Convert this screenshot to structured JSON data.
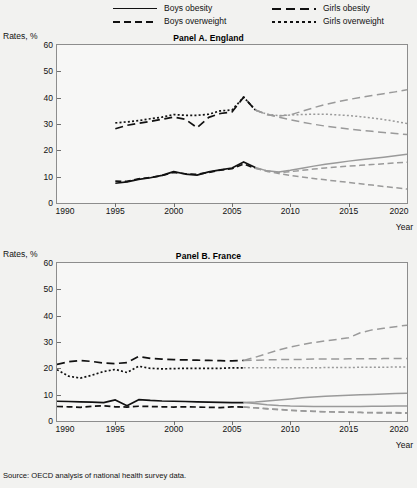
{
  "legend": {
    "items": [
      {
        "label": "Boys obesity",
        "style": "solid",
        "icon": "solid-line-swatch"
      },
      {
        "label": "Boys overweight",
        "style": "dash-medium",
        "icon": "dashed-line-swatch"
      },
      {
        "label": "Girls obesity",
        "style": "dash-long",
        "icon": "long-dashed-line-swatch"
      },
      {
        "label": "Girls overweight",
        "style": "dotted",
        "icon": "dotted-line-swatch"
      }
    ]
  },
  "source_note": "Source: OECD analysis of national health survey data.",
  "axis_labels": {
    "y": "Rates, %",
    "x": "Year"
  },
  "chart_data": [
    {
      "type": "line",
      "title": "Panel A. England",
      "xlabel": "Year",
      "ylabel": "Rates, %",
      "xlim": [
        1990,
        2020
      ],
      "ylim": [
        0,
        60
      ],
      "xticks": [
        1990,
        1995,
        2000,
        2005,
        2010,
        2015,
        2020
      ],
      "yticks": [
        0,
        10,
        20,
        30,
        40,
        50,
        60
      ],
      "grid": false,
      "legend_position": "top",
      "projection_starts": 2007,
      "series": [
        {
          "name": "Boys obesity",
          "style": "solid",
          "x": [
            1995,
            1996,
            1997,
            1998,
            1999,
            2000,
            2001,
            2002,
            2003,
            2004,
            2005,
            2006,
            2007,
            2008,
            2009,
            2010,
            2011,
            2012,
            2013,
            2014,
            2015,
            2016,
            2017,
            2018,
            2019,
            2020
          ],
          "values": [
            7.5,
            8.0,
            9.0,
            9.6,
            10.5,
            11.9,
            11.0,
            10.6,
            11.8,
            12.6,
            13.3,
            15.6,
            13.5,
            12.2,
            11.8,
            12.4,
            13.2,
            14.0,
            14.7,
            15.3,
            15.9,
            16.4,
            16.9,
            17.4,
            17.9,
            18.5
          ]
        },
        {
          "name": "Boys overweight",
          "style": "dash-medium",
          "x": [
            1995,
            1996,
            1997,
            1998,
            1999,
            2000,
            2001,
            2002,
            2003,
            2004,
            2005,
            2006,
            2007,
            2008,
            2009,
            2010,
            2011,
            2012,
            2013,
            2014,
            2015,
            2016,
            2017,
            2018,
            2019,
            2020
          ],
          "values": [
            8.3,
            8.2,
            9.2,
            9.7,
            10.4,
            11.6,
            11.1,
            10.9,
            11.6,
            12.5,
            13.0,
            14.8,
            13.2,
            12.2,
            11.6,
            11.9,
            12.4,
            12.9,
            13.3,
            13.7,
            14.0,
            14.3,
            14.6,
            14.9,
            15.2,
            15.5
          ]
        },
        {
          "name": "Girls obesity",
          "style": "dash-long",
          "x": [
            1995,
            1996,
            1997,
            1998,
            1999,
            2000,
            2001,
            2002,
            2003,
            2004,
            2005,
            2006,
            2007,
            2008,
            2009,
            2010,
            2011,
            2012,
            2013,
            2014,
            2015,
            2016,
            2017,
            2018,
            2019,
            2020
          ],
          "values": [
            28.2,
            29.5,
            30.3,
            31.0,
            31.8,
            32.6,
            31.8,
            28.6,
            32.5,
            34.0,
            34.6,
            40.2,
            35.3,
            33.5,
            33.0,
            33.5,
            34.8,
            36.2,
            37.4,
            38.4,
            39.3,
            40.1,
            40.8,
            41.5,
            42.2,
            43.0
          ]
        },
        {
          "name": "Girls overweight",
          "style": "dotted",
          "x": [
            1995,
            1996,
            1997,
            1998,
            1999,
            2000,
            2001,
            2002,
            2003,
            2004,
            2005,
            2006,
            2007,
            2008,
            2009,
            2010,
            2011,
            2012,
            2013,
            2014,
            2015,
            2016,
            2017,
            2018,
            2019,
            2020
          ],
          "values": [
            30.4,
            30.8,
            31.3,
            32.0,
            32.6,
            33.6,
            33.3,
            33.3,
            33.7,
            35.0,
            35.3,
            40.2,
            35.3,
            33.7,
            33.2,
            33.4,
            33.6,
            33.7,
            33.7,
            33.5,
            33.2,
            32.8,
            32.3,
            31.7,
            31.0,
            30.2
          ]
        },
        {
          "name": "Girls obesity projection low",
          "style": "dash-long",
          "x": [
            2007,
            2008,
            2009,
            2010,
            2011,
            2012,
            2013,
            2014,
            2015,
            2016,
            2017,
            2018,
            2019,
            2020
          ],
          "values": [
            35.3,
            33.7,
            32.6,
            31.6,
            30.7,
            29.9,
            29.2,
            28.6,
            28.1,
            27.6,
            27.2,
            26.8,
            26.4,
            26.0
          ],
          "is_projection": true
        },
        {
          "name": "Boys obesity projection low",
          "style": "dash-medium",
          "x": [
            2007,
            2008,
            2009,
            2010,
            2011,
            2012,
            2013,
            2014,
            2015,
            2016,
            2017,
            2018,
            2019,
            2020
          ],
          "values": [
            13.2,
            12.0,
            11.2,
            10.5,
            9.9,
            9.3,
            8.8,
            8.3,
            7.8,
            7.3,
            6.8,
            6.3,
            5.8,
            5.3
          ],
          "is_projection": true
        }
      ]
    },
    {
      "type": "line",
      "title": "Panel B. France",
      "xlabel": "Year",
      "ylabel": "Rates, %",
      "xlim": [
        1990,
        2020
      ],
      "ylim": [
        0,
        60
      ],
      "xticks": [
        1990,
        1995,
        2000,
        2005,
        2010,
        2015,
        2020
      ],
      "yticks": [
        0,
        10,
        20,
        30,
        40,
        50,
        60
      ],
      "grid": false,
      "legend_position": "top",
      "projection_starts": 2006,
      "series": [
        {
          "name": "Boys obesity",
          "style": "solid",
          "x": [
            1990,
            1991,
            1992,
            1993,
            1994,
            1995,
            1996,
            1997,
            1998,
            1999,
            2000,
            2001,
            2002,
            2003,
            2004,
            2005,
            2006,
            2007,
            2008,
            2009,
            2010,
            2011,
            2012,
            2013,
            2014,
            2015,
            2016,
            2017,
            2018,
            2019,
            2020
          ],
          "values": [
            7.5,
            7.4,
            7.3,
            7.2,
            7.0,
            8.0,
            5.8,
            8.1,
            7.8,
            7.6,
            7.5,
            7.4,
            7.3,
            7.2,
            7.1,
            7.0,
            7.0,
            7.2,
            7.6,
            8.0,
            8.4,
            8.8,
            9.1,
            9.4,
            9.6,
            9.8,
            10.0,
            10.1,
            10.3,
            10.4,
            10.5
          ]
        },
        {
          "name": "Boys overweight",
          "style": "dash-medium",
          "x": [
            1990,
            1991,
            1992,
            1993,
            1994,
            1995,
            1996,
            1997,
            1998,
            1999,
            2000,
            2001,
            2002,
            2003,
            2004,
            2005,
            2006,
            2007,
            2008,
            2009,
            2010,
            2011,
            2012,
            2013,
            2014,
            2015,
            2016,
            2017,
            2018,
            2019,
            2020
          ],
          "values": [
            5.5,
            5.4,
            5.2,
            5.6,
            5.8,
            5.4,
            5.3,
            5.6,
            5.5,
            5.4,
            5.3,
            5.4,
            5.3,
            5.2,
            5.1,
            5.4,
            5.3,
            5.0,
            4.7,
            4.4,
            4.1,
            3.9,
            3.7,
            3.5,
            3.4,
            3.3,
            3.2,
            3.1,
            3.0,
            3.0,
            2.9
          ]
        },
        {
          "name": "Girls obesity",
          "style": "dash-long",
          "x": [
            1990,
            1991,
            1992,
            1993,
            1994,
            1995,
            1996,
            1997,
            1998,
            1999,
            2000,
            2001,
            2002,
            2003,
            2004,
            2005,
            2006,
            2007,
            2008,
            2009,
            2010,
            2011,
            2012,
            2013,
            2014,
            2015,
            2016,
            2017,
            2018,
            2019,
            2020
          ],
          "values": [
            21.5,
            22.5,
            23.0,
            22.6,
            22.0,
            21.8,
            22.2,
            24.5,
            23.8,
            23.5,
            23.3,
            23.2,
            23.1,
            23.0,
            22.9,
            22.8,
            23.0,
            24.2,
            25.6,
            27.0,
            28.1,
            29.0,
            29.8,
            30.4,
            31.0,
            31.6,
            33.5,
            34.6,
            35.2,
            35.8,
            36.4
          ]
        },
        {
          "name": "Girls overweight",
          "style": "dotted",
          "x": [
            1990,
            1991,
            1992,
            1993,
            1994,
            1995,
            1996,
            1997,
            1998,
            1999,
            2000,
            2001,
            2002,
            2003,
            2004,
            2005,
            2006,
            2007,
            2008,
            2009,
            2010,
            2011,
            2012,
            2013,
            2014,
            2015,
            2016,
            2017,
            2018,
            2019,
            2020
          ],
          "values": [
            19.5,
            17.0,
            16.3,
            17.4,
            18.8,
            19.6,
            18.4,
            20.8,
            20.0,
            19.8,
            19.9,
            20.0,
            20.0,
            20.0,
            20.0,
            20.2,
            20.2,
            20.2,
            20.2,
            20.2,
            20.2,
            20.2,
            20.2,
            20.3,
            20.3,
            20.3,
            20.4,
            20.4,
            20.4,
            20.5,
            20.5
          ]
        },
        {
          "name": "Girls obesity projection low",
          "style": "dash-long",
          "x": [
            2006,
            2007,
            2008,
            2009,
            2010,
            2011,
            2012,
            2013,
            2014,
            2015,
            2016,
            2017,
            2018,
            2019,
            2020
          ],
          "values": [
            23.0,
            23.1,
            23.2,
            23.3,
            23.4,
            23.4,
            23.5,
            23.5,
            23.5,
            23.6,
            23.6,
            23.6,
            23.7,
            23.7,
            23.7
          ],
          "is_projection": true
        },
        {
          "name": "Boys obesity projection low",
          "style": "solid",
          "x": [
            2006,
            2007,
            2008,
            2009,
            2010,
            2011,
            2012,
            2013,
            2014,
            2015,
            2016,
            2017,
            2018,
            2019,
            2020
          ],
          "values": [
            7.0,
            6.6,
            6.2,
            5.9,
            5.7,
            5.6,
            5.5,
            5.5,
            5.5,
            5.5,
            5.5,
            5.6,
            5.6,
            5.7,
            5.7
          ],
          "is_projection": true
        },
        {
          "name": "Boys overweight projection low",
          "style": "dash-medium",
          "x": [
            2006,
            2007,
            2008,
            2009,
            2010,
            2011,
            2012,
            2013,
            2014,
            2015,
            2016,
            2017,
            2018,
            2019,
            2020
          ],
          "values": [
            5.3,
            5.0,
            4.6,
            4.3,
            4.0,
            3.8,
            3.6,
            3.5,
            3.4,
            3.3,
            3.3,
            3.2,
            3.2,
            3.2,
            3.1
          ],
          "is_projection": true
        }
      ]
    }
  ]
}
